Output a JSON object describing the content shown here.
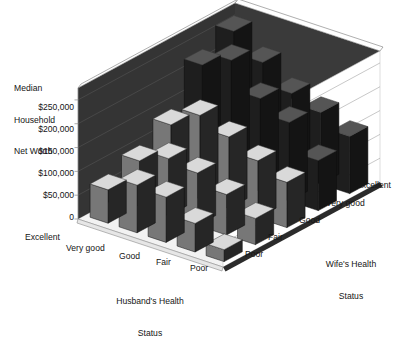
{
  "chart_data": {
    "type": "bar",
    "subtype": "3d-bar-matrix",
    "title": "",
    "ylabel": "Median\nHousehold\nNet Worth",
    "ytick_labels": [
      "$250,000",
      "$200,000",
      "$150,000",
      "$100,000",
      "$50,000",
      "0"
    ],
    "ytick_values": [
      250000,
      200000,
      150000,
      100000,
      50000,
      0
    ],
    "ylim": [
      0,
      275000
    ],
    "grid": true,
    "legend": "none",
    "xlabel": "Husband's Health\nStatus",
    "zlabel": "Wife's Health\nStatus",
    "x_categories": [
      "Excellent",
      "Very good",
      "Good",
      "Fair",
      "Poor"
    ],
    "z_categories": [
      "Poor",
      "Fair",
      "Good",
      "Very good",
      "Excellent"
    ],
    "z_categories_back_to_front": [
      "Excellent",
      "Very good",
      "Good",
      "Fair",
      "Poor"
    ],
    "series": [
      {
        "name": "Excellent",
        "values": [
          260000,
          215000,
          170000,
          150000,
          120000
        ]
      },
      {
        "name": "Very good",
        "values": [
          225000,
          255000,
          195000,
          165000,
          105000
        ]
      },
      {
        "name": "Good",
        "values": [
          135000,
          175000,
          150000,
          120000,
          95000
        ]
      },
      {
        "name": "Very good ",
        "values": [
          95000,
          120000,
          110000,
          85000,
          55000
        ]
      },
      {
        "name": "Poor",
        "values": [
          70000,
          100000,
          95000,
          60000,
          25000
        ]
      }
    ],
    "note": "series[i].values are indexed by Husband's Health Status (Excellent..Poor); series name is Wife's Health Status from back to front"
  },
  "axis": {
    "y_title_lines": [
      "Median",
      "Household",
      "Net Worth"
    ],
    "y_ticks": [
      "$250,000",
      "$200,000",
      "$150,000",
      "$100,000",
      "$50,000",
      "0"
    ],
    "x_title_lines": [
      "Husband's Health",
      "Status"
    ],
    "z_title_lines": [
      "Wife's Health",
      "Status"
    ],
    "x_ticks": [
      "Excellent",
      "Very good",
      "Good",
      "Fair",
      "Poor"
    ],
    "z_ticks": [
      "Poor",
      "Fair",
      "Good",
      "Very good",
      "Excellent"
    ]
  },
  "colors": {
    "back_wall": "#3a3a3a",
    "right_wall": "#ffffff",
    "floor": "#f2f2f2",
    "floor_edge": "#2b2b2b",
    "bar_top": "#d9d9d9",
    "bar_front": "#777777",
    "bar_side": "#262626",
    "bar_front_dark": "#1e1e1e",
    "bar_top_dark": "#555555",
    "gridline": "#9a9a9a",
    "text": "#151515"
  }
}
